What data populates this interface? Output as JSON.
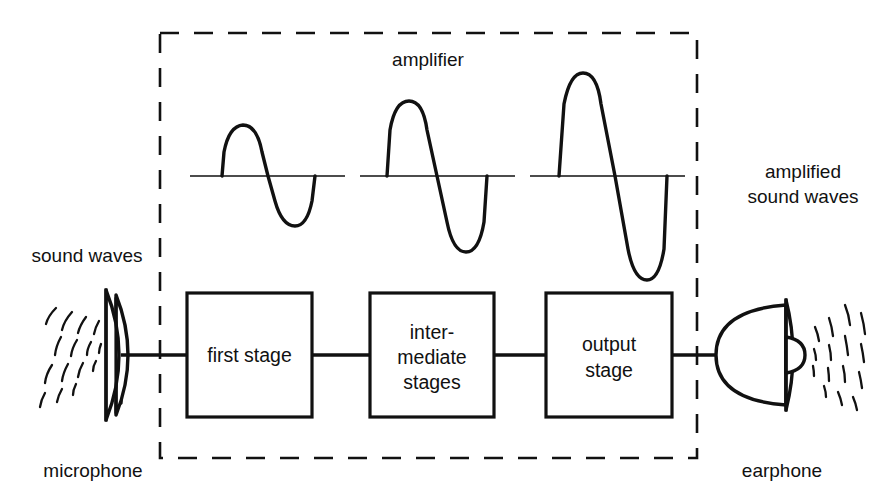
{
  "diagram": {
    "title_label": "amplifier",
    "left_label": "sound waves",
    "left_device_label": "microphone",
    "right_label_line1": "amplified",
    "right_label_line2": "sound waves",
    "right_device_label": "earphone",
    "stages": [
      {
        "id": "first-stage",
        "lines": [
          "first stage"
        ]
      },
      {
        "id": "intermediate-stages",
        "lines": [
          "inter-",
          "mediate",
          "stages"
        ]
      },
      {
        "id": "output-stage",
        "lines": [
          "output",
          "stage"
        ]
      }
    ],
    "waveforms": [
      {
        "id": "waveform-small",
        "amplitude_label": "small"
      },
      {
        "id": "waveform-medium",
        "amplitude_label": "medium"
      },
      {
        "id": "waveform-large",
        "amplitude_label": "large"
      }
    ],
    "colors": {
      "ink": "#111111",
      "background": "#ffffff"
    }
  }
}
